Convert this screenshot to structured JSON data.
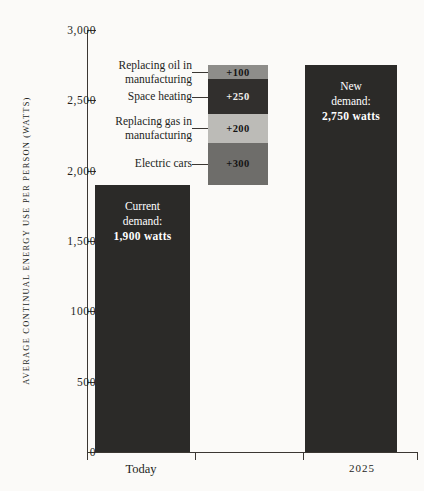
{
  "chart_data": {
    "type": "bar",
    "title": "",
    "subtitle": "",
    "xlabel": "",
    "ylabel": "AVERAGE CONTINUAL ENERGY USE PER PERSON (WATTS)",
    "ylim": [
      0,
      3000
    ],
    "ytick_values": [
      0,
      500,
      1000,
      1500,
      2000,
      2500,
      3000
    ],
    "ytick_labels": [
      "0",
      "500",
      "1000",
      "1,500",
      "2,000",
      "2,500",
      "3,000"
    ],
    "grid": false,
    "legend": "none",
    "categories": [
      "Today",
      "2025"
    ],
    "values": [
      1900,
      2750
    ],
    "bars": [
      {
        "category": "Today",
        "value": 1900,
        "label_line1": "Current",
        "label_line2": "demand:",
        "label_line3": "1,900 watts",
        "color": "#2b2a28"
      },
      {
        "category": "2025",
        "value": 2750,
        "label_line1": "New",
        "label_line2": "demand:",
        "label_line3": "2,750 watts",
        "color": "#2b2a28"
      }
    ],
    "increment_stack": {
      "base": 1900,
      "total": 2750,
      "segments": [
        {
          "label": "Replacing oil in manufacturing",
          "label_line1": "Replacing oil in",
          "label_line2": "manufacturing",
          "value": 100,
          "value_label": "+100",
          "from": 2650,
          "to": 2750,
          "color": "#8e8d8a",
          "text_color": "#141414"
        },
        {
          "label": "Space heating",
          "label_line1": "Space heating",
          "label_line2": "",
          "value": 250,
          "value_label": "+250",
          "from": 2400,
          "to": 2650,
          "color": "#312f2d",
          "text_color": "#f2f0ec"
        },
        {
          "label": "Replacing gas in manufacturing",
          "label_line1": "Replacing gas in",
          "label_line2": "manufacturing",
          "value": 200,
          "value_label": "+200",
          "from": 2200,
          "to": 2400,
          "color": "#bcbbb7",
          "text_color": "#141414"
        },
        {
          "label": "Electric cars",
          "label_line1": "Electric cars",
          "label_line2": "",
          "value": 300,
          "value_label": "+300",
          "from": 1900,
          "to": 2200,
          "color": "#6e6d6a",
          "text_color": "#141414"
        }
      ]
    }
  }
}
